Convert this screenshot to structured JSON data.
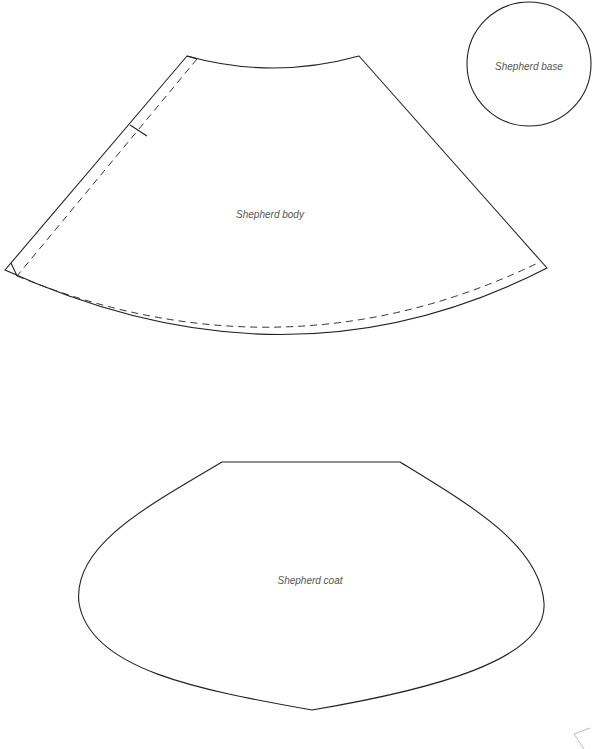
{
  "pieces": {
    "base": {
      "label": "Shepherd base",
      "shape": "circle"
    },
    "body": {
      "label": "Shepherd body",
      "shape": "sector-with-seam-allowance"
    },
    "coat": {
      "label": "Shepherd coat",
      "shape": "rounded-panel"
    }
  },
  "colors": {
    "background": "#ffffff",
    "line": "#222222",
    "label_text": "#555555"
  }
}
